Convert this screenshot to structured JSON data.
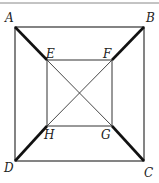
{
  "diagram": {
    "type": "geometry",
    "colors": {
      "line": "#333333",
      "background": "#ffffff"
    },
    "points": {
      "A": {
        "label": "A",
        "x": 15,
        "y": 27
      },
      "B": {
        "label": "B",
        "x": 144,
        "y": 27
      },
      "C": {
        "label": "C",
        "x": 144,
        "y": 161
      },
      "D": {
        "label": "D",
        "x": 15,
        "y": 161
      },
      "E": {
        "label": "E",
        "x": 47,
        "y": 60
      },
      "F": {
        "label": "F",
        "x": 112,
        "y": 60
      },
      "G": {
        "label": "G",
        "x": 112,
        "y": 126
      },
      "H": {
        "label": "H",
        "x": 47,
        "y": 126
      }
    },
    "outer_square": [
      "A",
      "B",
      "C",
      "D"
    ],
    "inner_square": [
      "E",
      "F",
      "G",
      "H"
    ],
    "thin_segments": [
      [
        "E",
        "G"
      ],
      [
        "F",
        "H"
      ]
    ],
    "thick_segments": [
      [
        "A",
        "E"
      ],
      [
        "B",
        "F"
      ],
      [
        "H",
        "D"
      ],
      [
        "G",
        "C"
      ]
    ]
  }
}
